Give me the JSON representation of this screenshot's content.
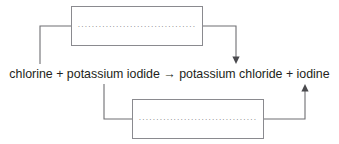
{
  "diagram": {
    "type": "chemical-reaction-labelling-exercise",
    "equation": {
      "text": "chlorine + potassium iodide → potassium chloride + iodine",
      "reactants": [
        "chlorine",
        "potassium iodide"
      ],
      "products": [
        "potassium chloride",
        "iodine"
      ],
      "arrow_symbol": "→"
    },
    "boxes": [
      {
        "id": "box-top",
        "content": "··································",
        "border_color": "#8a8a8f",
        "fill_color": "#ffffff"
      },
      {
        "id": "box-bottom",
        "content": "··································",
        "border_color": "#8a8a8f",
        "fill_color": "#ffffff"
      }
    ],
    "connectors": [
      {
        "id": "connector-top-left",
        "from": "box-top-left-edge",
        "to": "chlorine",
        "has_arrowhead": false
      },
      {
        "id": "connector-top-right",
        "from": "box-top-right-edge",
        "to": "potassium-chloride",
        "has_arrowhead": true,
        "arrow_direction": "down"
      },
      {
        "id": "connector-bottom-left",
        "from": "potassium-iodide",
        "to": "box-bottom-left-edge",
        "has_arrowhead": false
      },
      {
        "id": "connector-bottom-right",
        "from": "box-bottom-right-edge",
        "to": "iodine",
        "has_arrowhead": true,
        "arrow_direction": "up"
      }
    ],
    "colors": {
      "line": "#6e6e72",
      "arrow": "#4a4a4e",
      "text": "#231f20",
      "background": "#ffffff"
    }
  }
}
